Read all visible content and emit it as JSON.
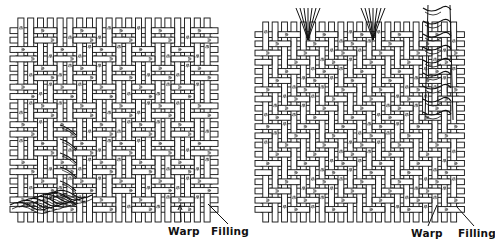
{
  "figure": {
    "panels": [
      {
        "id": "left",
        "weave": "basket weave (2 over 2, plain variant)",
        "labels": {
          "warp": "Warp",
          "filling": "Filling"
        },
        "feature": "raveled filling yarns at lower-left"
      },
      {
        "id": "right",
        "weave": "twill weave",
        "labels": {
          "warp": "Warp",
          "filling": "Filling"
        },
        "feature": "raveled warp yarns at top"
      }
    ]
  },
  "colors": {
    "ink": "#111111",
    "paper": "#ffffff"
  }
}
